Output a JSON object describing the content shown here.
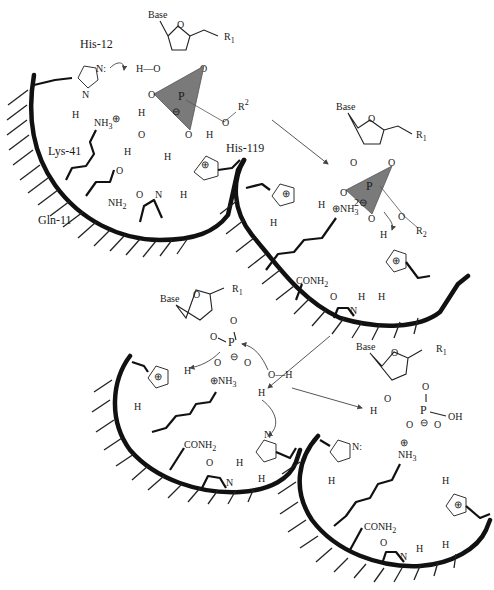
{
  "diagram": {
    "panels": [
      {
        "id": "panel-1",
        "description": "Substrate binding and transphosphorylation transition state",
        "residues": [
          "His-12",
          "Lys-41",
          "Gln-11",
          "His-119"
        ],
        "labels": {
          "his12": "His-12",
          "lys41": "Lys-41",
          "gln11": "Gln-11",
          "his119": "His-119",
          "base": "Base",
          "r1": "R",
          "r1_sub": "1",
          "r2": "R",
          "r2_sup": "2",
          "nh3": "NH",
          "nh3_sub": "3",
          "nh2": "NH",
          "nh2_sub": "2",
          "phosphorus": "P"
        }
      },
      {
        "id": "panel-2",
        "description": "2',3'-cyclic phosphate intermediate with leaving group R2-OH",
        "labels": {
          "base": "Base",
          "r1": "R",
          "r1_sub": "1",
          "r2": "R",
          "r2_sub": "2",
          "charge": "2⊖",
          "conh2": "CONH",
          "conh2_sub": "2",
          "nh3": "NH",
          "nh3_sub": "3",
          "phosphorus": "P"
        }
      },
      {
        "id": "panel-3",
        "description": "Water attack on cyclic phosphate (hydrolysis step)",
        "labels": {
          "base": "Base",
          "r1": "R",
          "r1_sub": "1",
          "water": "O—H",
          "conh2": "CONH",
          "conh2_sub": "2",
          "nh3": "NH",
          "nh3_sub": "3",
          "phosphorus": "P"
        }
      },
      {
        "id": "panel-4",
        "description": "Product: 3'-nucleotide released, enzyme regenerated",
        "labels": {
          "base": "Base",
          "r1": "R",
          "r1_sub": "1",
          "oh": "OH",
          "conh2": "CONH",
          "conh2_sub": "2",
          "nh3": "NH",
          "nh3_sub": "3",
          "phosphorus": "P"
        }
      }
    ],
    "atoms": {
      "H": "H",
      "O": "O",
      "N": "N",
      "N_lone": "N:",
      "plus": "⊕",
      "minus": "⊖"
    },
    "colors": {
      "line": "#111111",
      "tetrahedron": "#7a7a7a",
      "background": "#ffffff"
    }
  }
}
